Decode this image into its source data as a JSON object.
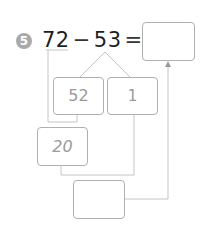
{
  "problem": {
    "number": "5",
    "minuend": "72",
    "operator": "−",
    "subtrahend": "53",
    "equals": "="
  },
  "boxes": {
    "answer": "",
    "split_left": "52",
    "split_right": "1",
    "intermediate": "20",
    "final": ""
  },
  "colors": {
    "badge": "#a9a9a9",
    "lines": "#c4c4c4",
    "box_border": "#b0b0b0",
    "handwriting": "#9a9a9a"
  }
}
